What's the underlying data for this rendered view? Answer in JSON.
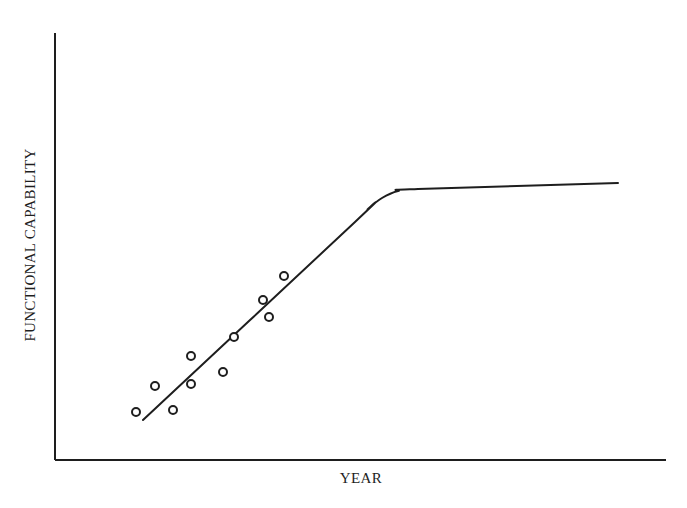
{
  "chart_data": {
    "type": "scatter",
    "title": "",
    "xlabel": "YEAR",
    "ylabel": "FUNCTIONAL CAPABILITY",
    "x_ticks": [],
    "y_ticks": [],
    "grid": false,
    "legend": null,
    "axes": {
      "origin_px": [
        55,
        460
      ],
      "x_end_px": [
        666,
        460
      ],
      "y_end_px": [
        55,
        33
      ]
    },
    "series": [
      {
        "name": "observations",
        "kind": "scatter",
        "marker": "open-circle",
        "points_px": [
          [
            136,
            412
          ],
          [
            155,
            386
          ],
          [
            173,
            410
          ],
          [
            191,
            356
          ],
          [
            191,
            384
          ],
          [
            223,
            372
          ],
          [
            234,
            337
          ],
          [
            263,
            300
          ],
          [
            269,
            317
          ],
          [
            284,
            276
          ]
        ]
      },
      {
        "name": "trend (linear growth then saturation)",
        "kind": "line",
        "points_px": [
          [
            143,
            420
          ],
          [
            355,
            222
          ],
          [
            368,
            209
          ],
          [
            382,
            198
          ],
          [
            398,
            191
          ],
          [
            418,
            189
          ],
          [
            618,
            183
          ]
        ]
      }
    ]
  },
  "colors": {
    "ink": "#1e1e1e",
    "background": "#ffffff"
  }
}
